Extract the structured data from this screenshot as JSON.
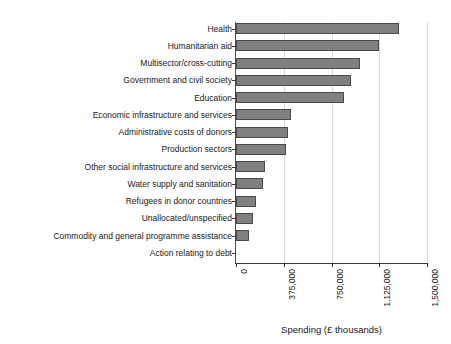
{
  "chart_data": {
    "type": "bar",
    "orientation": "horizontal",
    "title": "",
    "subtitle": "",
    "xlabel": "Spending (£ thousands)",
    "ylabel": "",
    "xlim": [
      0,
      1500000
    ],
    "xticks": [
      0,
      375000,
      750000,
      1125000,
      1500000
    ],
    "xtick_labels": [
      "0",
      "375,000",
      "750,000",
      "1,125,000",
      "1,500,000"
    ],
    "grid": "vertical",
    "legend": "none",
    "bar_color": "#808080",
    "bar_edge_color": "#4a4a4a",
    "grid_color": "#d9d9d9",
    "axis_color": "#3a3a3a",
    "categories": [
      "Health",
      "Humanitarian aid",
      "Multisector/cross-cutting",
      "Government and civil society",
      "Education",
      "Economic infrastructure and services",
      "Administrative costs of donors",
      "Production sectors",
      "Other social infrastructure and services",
      "Water supply and sanitation",
      "Refugees in donor countries",
      "Unallocated/unspecified",
      "Commodity and general programme assistance",
      "Action relating to debt"
    ],
    "values": [
      1280000,
      1120000,
      970000,
      900000,
      845000,
      430000,
      405000,
      390000,
      225000,
      215000,
      160000,
      130000,
      100000,
      0
    ]
  }
}
